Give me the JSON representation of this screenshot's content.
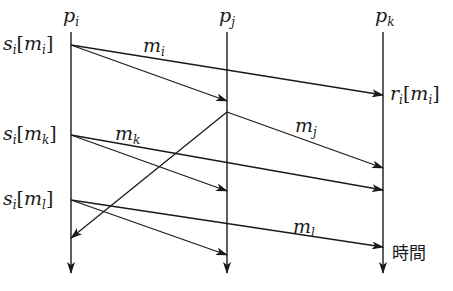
{
  "processes": [
    {
      "id": "pi",
      "base": "p",
      "sub": "i",
      "x": 71
    },
    {
      "id": "pj",
      "base": "p",
      "sub": "j",
      "x": 227
    },
    {
      "id": "pk",
      "base": "p",
      "sub": "k",
      "x": 383
    }
  ],
  "events": {
    "send_mi": {
      "base": "s",
      "sub": "i",
      "arg": "m",
      "argsub": "i"
    },
    "send_mk": {
      "base": "s",
      "sub": "i",
      "arg": "m",
      "argsub": "k"
    },
    "send_ml": {
      "base": "s",
      "sub": "i",
      "arg": "m",
      "argsub": "l"
    },
    "recv_mi": {
      "base": "r",
      "sub": "i",
      "arg": "m",
      "argsub": "i"
    }
  },
  "messages": {
    "mi": {
      "base": "m",
      "sub": "i"
    },
    "mj": {
      "base": "m",
      "sub": "j"
    },
    "mk": {
      "base": "m",
      "sub": "k"
    },
    "ml": {
      "base": "m",
      "sub": "l"
    }
  },
  "time_label": "時間",
  "colors": {
    "line": "#1a1a1a",
    "background": "#ffffff"
  }
}
